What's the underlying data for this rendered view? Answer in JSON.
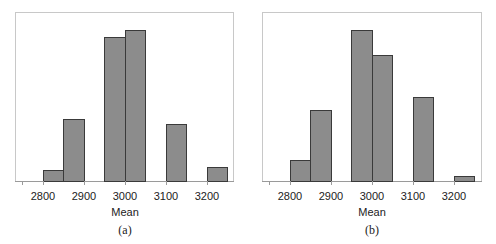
{
  "chart_data": [
    {
      "type": "bar",
      "subtype": "histogram",
      "caption": "(a)",
      "xlabel": "Mean",
      "ylabel": "",
      "xlim": [
        2750,
        3250
      ],
      "xticks": [
        2800,
        2900,
        3000,
        3100,
        3200
      ],
      "y_axis_labeled": false,
      "bin_width": 50,
      "bins": [
        {
          "start": 2800,
          "end": 2850,
          "relative_height": 11
        },
        {
          "start": 2850,
          "end": 2900,
          "relative_height": 62
        },
        {
          "start": 2950,
          "end": 3000,
          "relative_height": 144
        },
        {
          "start": 3000,
          "end": 3050,
          "relative_height": 151
        },
        {
          "start": 3100,
          "end": 3150,
          "relative_height": 57
        },
        {
          "start": 3200,
          "end": 3250,
          "relative_height": 14
        }
      ],
      "grid": false,
      "legend": null
    },
    {
      "type": "bar",
      "subtype": "histogram",
      "caption": "(b)",
      "xlabel": "Mean",
      "ylabel": "",
      "xlim": [
        2750,
        3250
      ],
      "xticks": [
        2800,
        2900,
        3000,
        3100,
        3200
      ],
      "y_axis_labeled": false,
      "bin_width": 50,
      "bins": [
        {
          "start": 2800,
          "end": 2850,
          "relative_height": 21
        },
        {
          "start": 2850,
          "end": 2900,
          "relative_height": 71
        },
        {
          "start": 2950,
          "end": 3000,
          "relative_height": 151
        },
        {
          "start": 3000,
          "end": 3050,
          "relative_height": 126
        },
        {
          "start": 3100,
          "end": 3150,
          "relative_height": 84
        },
        {
          "start": 3200,
          "end": 3250,
          "relative_height": 5
        }
      ],
      "grid": false,
      "legend": null
    }
  ],
  "colors": {
    "bar_fill": "#8c8c8c",
    "bar_edge": "#3a3a3a",
    "frame": "#c8c8c8"
  },
  "panels": [
    {
      "caption": "(a)",
      "xlabel": "Mean",
      "tick_labels": [
        "2800",
        "2900",
        "3000",
        "3100",
        "3200"
      ]
    },
    {
      "caption": "(b)",
      "xlabel": "Mean",
      "tick_labels": [
        "2800",
        "2900",
        "3000",
        "3100",
        "3200"
      ]
    }
  ]
}
